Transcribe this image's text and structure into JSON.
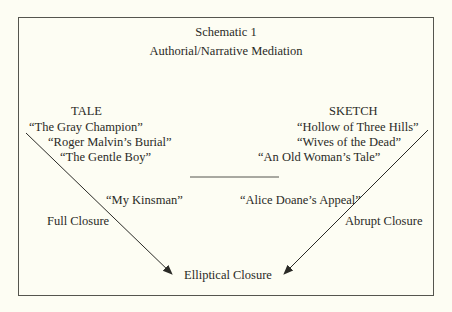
{
  "diagram": {
    "title": "Schematic 1",
    "subtitle": "Authorial/Narrative Mediation",
    "left_column": {
      "heading": "TALE",
      "items": [
        "“The Gray Champion”",
        "“Roger Malvin’s Burial”",
        "“The Gentle Boy”"
      ]
    },
    "right_column": {
      "heading": "SKETCH",
      "items": [
        "“Hollow of Three Hills”",
        "“Wives of the Dead”",
        "“An Old Woman’s Tale”"
      ]
    },
    "middle_left_item": "“My Kinsman”",
    "middle_right_item": "“Alice Doane’s Appeal”",
    "left_arrow_label": "Full Closure",
    "right_arrow_label": "Abrupt Closure",
    "convergence_label": "Elliptical Closure",
    "colors": {
      "background": "#fdfdf3",
      "ink": "#2a2a26",
      "frame": "#55554e"
    }
  }
}
